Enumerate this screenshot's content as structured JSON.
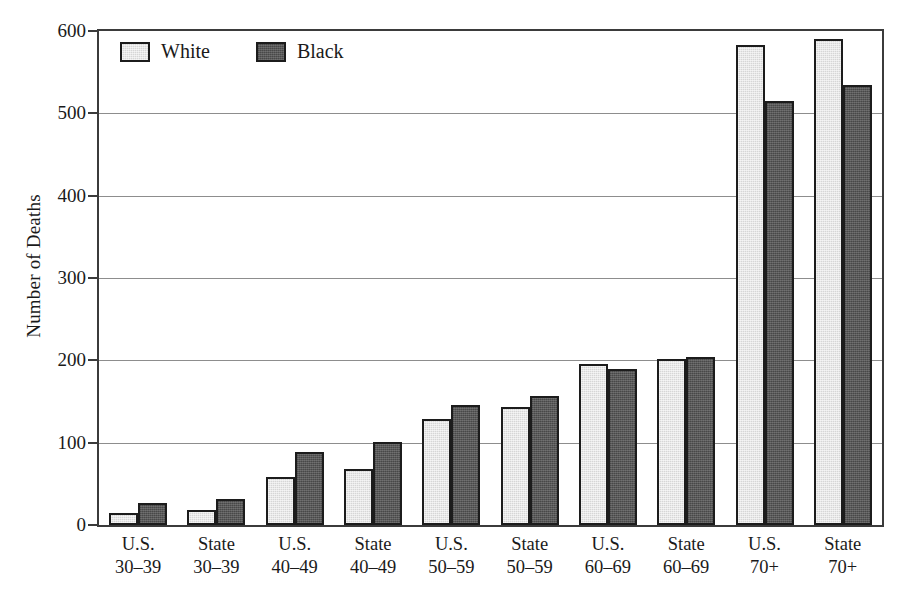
{
  "chart_data": {
    "type": "bar",
    "title": "",
    "subtitle": "",
    "xlabel": "",
    "ylabel": "Number of Deaths",
    "ylim": [
      0,
      600
    ],
    "yticks": [
      0,
      100,
      200,
      300,
      400,
      500,
      600
    ],
    "ytick_labels": [
      "0",
      "100",
      "200",
      "300",
      "400",
      "500",
      "600"
    ],
    "grid": true,
    "grid_axis": "y",
    "legend_position": "top-left-inside",
    "categories": [
      "U.S. 30–39",
      "State 30–39",
      "U.S. 40–49",
      "State 40–49",
      "U.S. 50–59",
      "State 50–59",
      "U.S. 60–69",
      "State 60–69",
      "U.S. 70+",
      "State 70+"
    ],
    "category_lines": [
      {
        "line1": "U.S.",
        "line2": "30–39"
      },
      {
        "line1": "State",
        "line2": "30–39"
      },
      {
        "line1": "U.S.",
        "line2": "40–49"
      },
      {
        "line1": "State",
        "line2": "40–49"
      },
      {
        "line1": "U.S.",
        "line2": "50–59"
      },
      {
        "line1": "State",
        "line2": "50–59"
      },
      {
        "line1": "U.S.",
        "line2": "60–69"
      },
      {
        "line1": "State",
        "line2": "60–69"
      },
      {
        "line1": "U.S.",
        "line2": "70+"
      },
      {
        "line1": "State",
        "line2": "70+"
      }
    ],
    "series": [
      {
        "name": "White",
        "color": "#d6d6d6",
        "values": [
          15,
          18,
          58,
          68,
          129,
          143,
          196,
          202,
          583,
          590
        ]
      },
      {
        "name": "Black",
        "color": "#585858",
        "values": [
          27,
          32,
          89,
          101,
          146,
          157,
          190,
          204,
          515,
          535
        ]
      }
    ]
  },
  "legend": {
    "items": [
      {
        "label": "White",
        "swatch": "white"
      },
      {
        "label": "Black",
        "swatch": "black"
      }
    ]
  },
  "axes": {
    "y_title": "Number of Deaths"
  },
  "colors": {
    "white_bar": "#d6d6d6",
    "black_bar": "#585858",
    "outline": "#1c1c1c",
    "gridline": "#8d8d8d",
    "frame": "#3b3b3b",
    "background": "#ffffff"
  }
}
